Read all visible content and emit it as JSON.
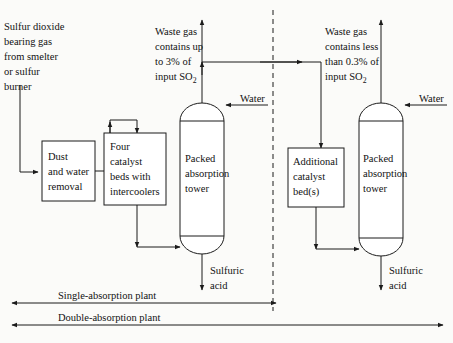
{
  "diagram": {
    "colors": {
      "line": "#1b1b1b",
      "background": "#fbfbf9",
      "vessel_fill": "#ffffff"
    },
    "feed_label": {
      "lines": [
        "Sulfur dioxide",
        "bearing gas",
        "from smelter",
        "or sulfur",
        "burner"
      ]
    },
    "boxes": [
      {
        "id": "dust-and-water-removal",
        "lines": [
          "Dust",
          "and water",
          "removal"
        ]
      },
      {
        "id": "four-catalyst-beds",
        "lines": [
          "Four",
          "catalyst",
          "beds with",
          "intercoolers"
        ]
      },
      {
        "id": "additional-catalyst-beds",
        "lines": [
          "Additional",
          "catalyst",
          "bed(s)"
        ]
      }
    ],
    "towers": [
      {
        "id": "first-packed-absorption-tower",
        "lines": [
          "Packed",
          "absorption",
          "tower"
        ]
      },
      {
        "id": "second-packed-absorption-tower",
        "lines": [
          "Packed",
          "absorption",
          "tower"
        ]
      }
    ],
    "waste_gas_left": {
      "lines": [
        "Waste gas",
        "contains up",
        "to 3% of",
        "input SO"
      ],
      "subscript": "2"
    },
    "waste_gas_right": {
      "lines": [
        "Waste gas",
        "contains less",
        "than 0.3% of",
        "input SO"
      ],
      "subscript": "2"
    },
    "water_inlet_left": "Water",
    "water_inlet_right": "Water",
    "product_left": {
      "lines": [
        "Sulfuric",
        "acid"
      ]
    },
    "product_right": {
      "lines": [
        "Sulfuric",
        "acid"
      ]
    },
    "spans": [
      {
        "id": "single-absorption-plant",
        "label": "Single-absorption plant"
      },
      {
        "id": "double-absorption-plant",
        "label": "Double-absorption plant"
      }
    ]
  }
}
